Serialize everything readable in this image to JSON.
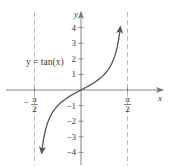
{
  "chart_data": {
    "type": "line",
    "title": "",
    "function_label": "y = tan(x)",
    "xlabel": "x",
    "ylabel": "y",
    "xlim": [
      -2.2,
      2.3
    ],
    "ylim": [
      -4.4,
      4.6
    ],
    "grid": false,
    "legend": null,
    "x_ticks": [
      {
        "value": -1.5708,
        "label_num": "π",
        "label_den": "2",
        "sign": "−"
      },
      {
        "value": 1.5708,
        "label_num": "π",
        "label_den": "2",
        "sign": ""
      }
    ],
    "y_ticks": [
      {
        "value": 4,
        "label": "4"
      },
      {
        "value": 3,
        "label": "3"
      },
      {
        "value": 2,
        "label": "2"
      },
      {
        "value": 1,
        "label": "1"
      },
      {
        "value": -1,
        "label": "−1"
      },
      {
        "value": -2,
        "label": "−2"
      },
      {
        "value": -3,
        "label": "−3"
      },
      {
        "value": -4,
        "label": "−4"
      }
    ],
    "asymptotes": [
      {
        "x": -1.5708,
        "style": "dashed"
      },
      {
        "x": 1.5708,
        "style": "dashed"
      }
    ],
    "series": [
      {
        "name": "y = tan(x)",
        "x": [
          -1.33,
          -1.2,
          -1.0,
          -0.8,
          -0.6,
          -0.4,
          -0.2,
          0,
          0.2,
          0.4,
          0.6,
          0.8,
          1.0,
          1.2,
          1.33
        ],
        "values": [
          -4.11,
          -2.57,
          -1.56,
          -1.03,
          -0.68,
          -0.42,
          -0.2,
          0,
          0.2,
          0.42,
          0.68,
          1.03,
          1.56,
          2.57,
          4.11
        ],
        "arrows": "both-ends"
      }
    ]
  },
  "colors": {
    "curve": "#555555",
    "axes": "#777777",
    "asymptote": "#bbbbbb",
    "text": "#3a3a3a"
  }
}
